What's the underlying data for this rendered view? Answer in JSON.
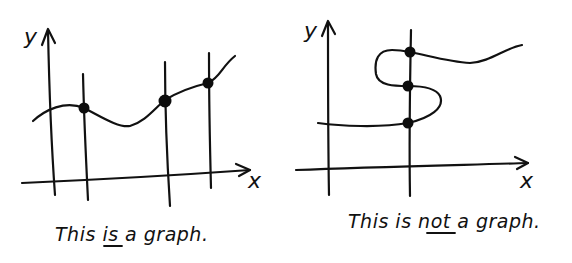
{
  "panels": [
    {
      "id": "left",
      "y_axis_label": "y",
      "x_axis_label": "x",
      "caption_parts": [
        "This ",
        "is",
        " a graph."
      ],
      "caption_emphasis": "is",
      "vertical_line_count": 3,
      "intersection_count": 3,
      "is_graph": true
    },
    {
      "id": "right",
      "y_axis_label": "y",
      "x_axis_label": "x",
      "caption_parts": [
        "This is ",
        "not",
        " a graph."
      ],
      "caption_emphasis": "not",
      "vertical_line_count": 1,
      "intersection_count": 3,
      "is_graph": false
    }
  ],
  "colors": {
    "ink": "#111111",
    "background": "#ffffff"
  }
}
